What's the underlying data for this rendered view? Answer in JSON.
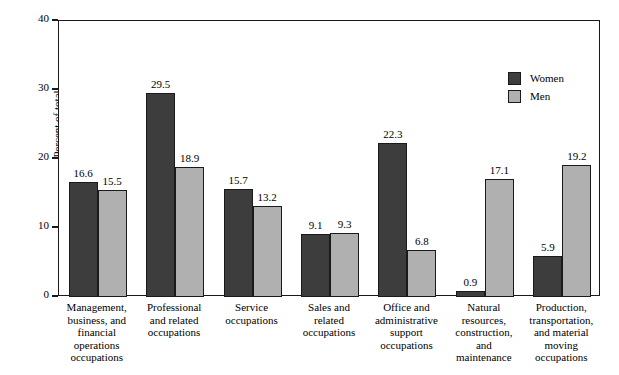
{
  "chart_data": {
    "type": "bar",
    "title": "",
    "xlabel": "",
    "ylabel": "Percent of total",
    "ylim": [
      0,
      40
    ],
    "yticks": [
      "0",
      "10",
      "20",
      "30",
      "40"
    ],
    "grid": false,
    "legend_position": "top-right",
    "categories": [
      "Management, business, and financial operations occupations",
      "Professional and related occupations",
      "Service occupations",
      "Sales and related occupations",
      "Office and administrative support occupations",
      "Natural resources, construction, and maintenance",
      "Production, transportation, and material moving occupations"
    ],
    "category_lines": [
      [
        "Management,",
        "business, and",
        "financial",
        "operations",
        "occupations"
      ],
      [
        "Professional",
        "and related",
        "occupations"
      ],
      [
        "Service",
        "occupations"
      ],
      [
        "Sales and",
        "related",
        "occupations"
      ],
      [
        "Office and",
        "administrative",
        "support",
        "occupations"
      ],
      [
        "Natural",
        "resources,",
        "construction,",
        "and",
        "maintenance"
      ],
      [
        "Production,",
        "transportation,",
        "and material",
        "moving",
        "occupations"
      ]
    ],
    "series": [
      {
        "name": "Women",
        "color": "#3d3d3d",
        "values": [
          16.6,
          29.5,
          15.7,
          9.1,
          22.3,
          0.9,
          5.9
        ],
        "labels": [
          "16.6",
          "29.5",
          "15.7",
          "9.1",
          "22.3",
          "0.9",
          "5.9"
        ]
      },
      {
        "name": "Men",
        "color": "#b0b0b0",
        "values": [
          15.5,
          18.9,
          13.2,
          9.3,
          6.8,
          17.1,
          19.2
        ],
        "labels": [
          "15.5",
          "18.9",
          "13.2",
          "9.3",
          "6.8",
          "17.1",
          "19.2"
        ]
      }
    ]
  },
  "legend": {
    "items": [
      {
        "label": "Women",
        "color": "#3d3d3d"
      },
      {
        "label": "Men",
        "color": "#b0b0b0"
      }
    ]
  },
  "axis": {
    "y_title": "Percent of total"
  }
}
